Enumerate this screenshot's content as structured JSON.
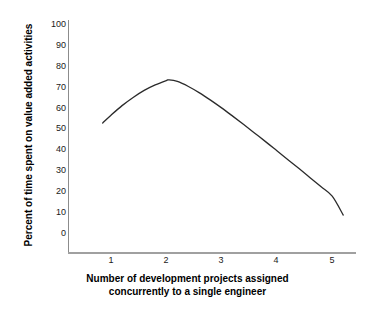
{
  "chart_data": {
    "type": "line",
    "title": "",
    "xlabel_lines": [
      "Number of development projects assigned",
      "concurrently to a single engineer"
    ],
    "xlabel": "Number of development projects assigned concurrently to a single engineer",
    "ylabel": "Percent of time spent on value added activities",
    "xlim": [
      0.0,
      5.6
    ],
    "ylim": [
      0,
      100
    ],
    "xticks": [
      1,
      2,
      3,
      4,
      5
    ],
    "xtick_labels": [
      "1",
      "2",
      "3",
      "4",
      "5"
    ],
    "yticks": [
      0,
      10,
      20,
      30,
      40,
      50,
      60,
      70,
      80,
      90,
      100
    ],
    "ytick_labels": [
      "0",
      "10",
      "20",
      "30",
      "40",
      "50",
      "60",
      "70",
      "80",
      "90",
      "100"
    ],
    "grid": false,
    "legend": null,
    "series": [
      {
        "name": "value added time",
        "color": "#2b2b2b",
        "linewidth": 1.3,
        "x": [
          0.85,
          1.0,
          1.2,
          1.4,
          1.6,
          1.8,
          2.0,
          2.05,
          2.2,
          2.4,
          2.6,
          2.8,
          3.0,
          3.2,
          3.4,
          3.6,
          3.8,
          4.0,
          4.2,
          4.4,
          4.6,
          4.8,
          5.0,
          5.2
        ],
        "y": [
          56.6,
          60.0,
          64.2,
          67.8,
          70.9,
          73.3,
          75.2,
          75.5,
          74.8,
          72.6,
          69.8,
          66.6,
          63.2,
          59.6,
          55.9,
          52.1,
          48.3,
          44.4,
          40.5,
          36.6,
          32.6,
          28.6,
          24.5,
          16.2
        ]
      }
    ],
    "annotations": []
  },
  "axes": {
    "xtick_labels": [
      "1",
      "2",
      "3",
      "4",
      "5"
    ],
    "ytick_labels": [
      "0",
      "10",
      "20",
      "30",
      "40",
      "50",
      "60",
      "70",
      "80",
      "90",
      "100"
    ],
    "xlabel_line1": "Number of development projects assigned",
    "xlabel_line2": "concurrently to a single engineer",
    "ylabel": "Percent of time spent on value added activities"
  },
  "colors": {
    "curve": "#2b2b2b",
    "axis": "#9a9a9a",
    "tick_text": "#1a1a1a",
    "label_text": "#000000",
    "background": "#ffffff"
  }
}
